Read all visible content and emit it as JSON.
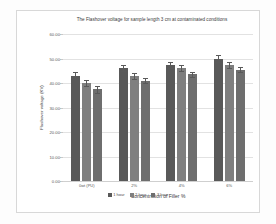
{
  "chart_data": {
    "type": "bar",
    "title": "The Flashover voltage for sample length 3 cm at contaminated conditions",
    "xlabel": "Concentration of Filler %",
    "ylabel": "Flashover voltage (KV)",
    "categories": [
      "0wt (PU)",
      "2%",
      "4%",
      "6%"
    ],
    "series": [
      {
        "name": "1 hour",
        "color": "#595959",
        "values": [
          43.0,
          46.0,
          47.5,
          50.0
        ],
        "errors": [
          1.3,
          1.2,
          1.2,
          1.3
        ]
      },
      {
        "name": "2 hour",
        "color": "#7f7f7f",
        "values": [
          40.0,
          43.0,
          46.0,
          47.5
        ],
        "errors": [
          1.2,
          1.2,
          1.2,
          1.2
        ]
      },
      {
        "name": "3 hour",
        "color": "#6e6e6e",
        "values": [
          37.5,
          41.0,
          43.5,
          45.5
        ],
        "errors": [
          1.4,
          1.1,
          1.2,
          1.1
        ]
      }
    ],
    "ylim": [
      0,
      60
    ],
    "yticks": [
      "0.00",
      "10.00",
      "20.00",
      "30.00",
      "40.00",
      "50.00",
      "60.00"
    ],
    "ytick_values": [
      0,
      10,
      20,
      30,
      40,
      50,
      60
    ],
    "grid": true,
    "legend_position": "bottom",
    "error_bars": true
  }
}
